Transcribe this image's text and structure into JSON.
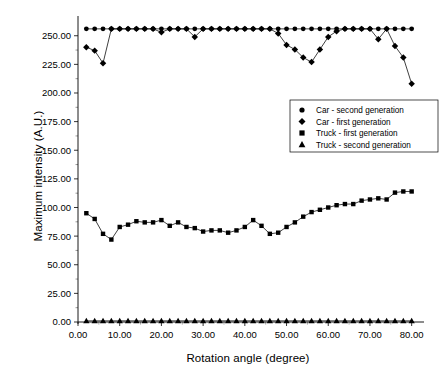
{
  "chart_data": {
    "type": "line",
    "title": "",
    "xlabel": "Rotation angle (degree)",
    "ylabel": "Maximum intensity (A.U.)",
    "xlim": [
      0,
      82
    ],
    "ylim": [
      0,
      262
    ],
    "xticks": [
      0,
      10,
      20,
      30,
      40,
      50,
      60,
      70,
      80
    ],
    "yticks": [
      0,
      25,
      50,
      75,
      100,
      125,
      150,
      175,
      200,
      225,
      250
    ],
    "xtick_labels": [
      "0.00",
      "10.00",
      "20.00",
      "30.00",
      "40.00",
      "50.00",
      "60.00",
      "70.00",
      "80.00"
    ],
    "ytick_labels": [
      "0.00",
      "25.00",
      "50.00",
      "75.00",
      "100.00",
      "125.00",
      "150.00",
      "175.00",
      "200.00",
      "225.00",
      "250.00"
    ],
    "grid": false,
    "legend_position": "center-right",
    "x": [
      2,
      4,
      6,
      8,
      10,
      12,
      14,
      16,
      18,
      20,
      22,
      24,
      26,
      28,
      30,
      32,
      34,
      36,
      38,
      40,
      42,
      44,
      46,
      48,
      50,
      52,
      54,
      56,
      58,
      60,
      62,
      64,
      66,
      68,
      70,
      72,
      74,
      76,
      78,
      80
    ],
    "series": [
      {
        "name": "Car - second generation",
        "marker": "circle",
        "values": [
          256,
          256,
          256,
          256,
          256,
          256,
          256,
          256,
          256,
          256,
          256,
          256,
          256,
          256,
          256,
          256,
          256,
          256,
          256,
          256,
          256,
          256,
          256,
          256,
          256,
          256,
          256,
          256,
          256,
          256,
          256,
          256,
          256,
          256,
          256,
          256,
          256,
          256,
          256,
          256
        ]
      },
      {
        "name": "Car - first generation",
        "marker": "diamond",
        "values": [
          240,
          237,
          226,
          256,
          256,
          256,
          256,
          256,
          256,
          253,
          256,
          256,
          256,
          249,
          256,
          256,
          256,
          256,
          256,
          256,
          256,
          256,
          256,
          252,
          242,
          238,
          231,
          227,
          238,
          249,
          254,
          256,
          256,
          256,
          256,
          247,
          237,
          256,
          256,
          256
        ]
      },
      {
        "name": "Truck - first generation",
        "marker": "square",
        "values": [
          95,
          90,
          77,
          72,
          83,
          85,
          88,
          87,
          87,
          89,
          84,
          87,
          83,
          82,
          79,
          80,
          80,
          78,
          80,
          83,
          89,
          84,
          77,
          78,
          83,
          87,
          92,
          96,
          98,
          100,
          102,
          103,
          103,
          106,
          107,
          108,
          107,
          113,
          114,
          114
        ]
      },
      {
        "name": "Truck - second generation",
        "marker": "triangle",
        "values": [
          1,
          1,
          1,
          1,
          1,
          1,
          1,
          1,
          1,
          1,
          1,
          1,
          1,
          1,
          1,
          1,
          1,
          1,
          1,
          1,
          1,
          1,
          1,
          1,
          1,
          1,
          1,
          1,
          1,
          1,
          1,
          1,
          1,
          1,
          1,
          1,
          1,
          1,
          1,
          1
        ]
      }
    ],
    "second_trace_tail": {
      "note": "Car - first generation descends at far right",
      "x": [
        74,
        76,
        78,
        80
      ],
      "values": [
        256,
        241,
        231,
        208
      ]
    },
    "colors": {
      "series": "#000000",
      "axis": "#000000",
      "background": "#ffffff"
    }
  },
  "legend": {
    "items": [
      {
        "label": "Car - second generation",
        "marker": "circle"
      },
      {
        "label": "Car - first generation",
        "marker": "diamond"
      },
      {
        "label": "Truck - first generation",
        "marker": "square"
      },
      {
        "label": "Truck - second generation",
        "marker": "triangle"
      }
    ]
  },
  "axes": {
    "x_title": "Rotation angle (degree)",
    "y_title": "Maximum intensity (A.U.)"
  }
}
